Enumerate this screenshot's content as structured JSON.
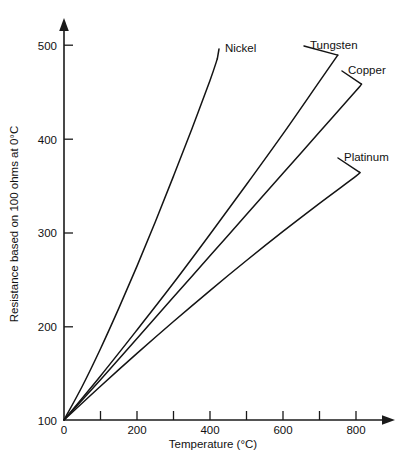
{
  "chart_data": {
    "type": "line",
    "title": "",
    "xlabel": "Temperature (°C)",
    "ylabel": "Resistance based on 100 ohms at 0°C",
    "xlim": [
      0,
      900
    ],
    "ylim": [
      100,
      520
    ],
    "grid": false,
    "legend_position": "inline-curve-labels",
    "x_ticks": [
      0,
      100,
      200,
      300,
      400,
      500,
      600,
      700,
      800
    ],
    "x_tick_labels": [
      "0",
      "",
      "200",
      "",
      "400",
      "",
      "600",
      "",
      "800"
    ],
    "y_ticks": [
      100,
      200,
      300,
      400,
      500
    ],
    "y_tick_labels": [
      "100",
      "200",
      "300",
      "400",
      "500"
    ],
    "series": [
      {
        "name": "Nickel",
        "label": "Nickel",
        "x": [
          0,
          50,
          100,
          150,
          200,
          250,
          300,
          350,
          400,
          420
        ],
        "values": [
          100,
          136,
          176,
          219,
          264,
          311,
          360,
          410,
          462,
          485
        ]
      },
      {
        "name": "Tungsten",
        "label": "Tungsten",
        "x": [
          0,
          100,
          200,
          300,
          400,
          500,
          600,
          700,
          750
        ],
        "values": [
          100,
          147,
          196,
          246,
          298,
          351,
          405,
          461,
          489
        ]
      },
      {
        "name": "Copper",
        "label": "Copper",
        "x": [
          0,
          100,
          200,
          300,
          400,
          500,
          600,
          700,
          800,
          815
        ],
        "values": [
          100,
          143,
          187,
          231,
          275,
          319,
          363,
          407,
          451,
          458
        ]
      },
      {
        "name": "Platinum",
        "label": "Platinum",
        "x": [
          0,
          100,
          200,
          300,
          400,
          500,
          600,
          700,
          800,
          810
        ],
        "values": [
          100,
          136,
          171,
          205,
          238,
          270,
          301,
          331,
          360,
          364
        ]
      }
    ],
    "series_label_positions": [
      {
        "name": "Nickel",
        "x": 225,
        "y": 52
      },
      {
        "name": "Tungsten",
        "x": 310,
        "y": 49
      },
      {
        "name": "Copper",
        "x": 348,
        "y": 74
      },
      {
        "name": "Platinum",
        "x": 344,
        "y": 161
      }
    ],
    "colors": {
      "axis": "#1a1a1a",
      "curve": "#141414",
      "background": "#ffffff",
      "text": "#111111"
    }
  }
}
